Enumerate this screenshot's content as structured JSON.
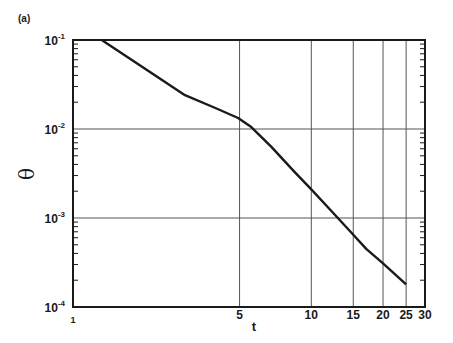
{
  "panel_label": "(a)",
  "chart_data": {
    "type": "line",
    "title": "",
    "xlabel": "t",
    "ylabel": "θ",
    "xscale": "log",
    "yscale": "log",
    "xlim": [
      1,
      30
    ],
    "ylim": [
      0.0001,
      0.1
    ],
    "grid": true,
    "legend": "none",
    "x_ticks": [
      1,
      5,
      10,
      15,
      20,
      25,
      30
    ],
    "x_tick_labels": [
      "1",
      "5",
      "10",
      "15",
      "20",
      "25",
      "30"
    ],
    "y_ticks": [
      0.1,
      0.01,
      0.001,
      0.0001
    ],
    "y_tick_labels": [
      {
        "base": "10",
        "exp": "-1"
      },
      {
        "base": "10",
        "exp": "-2"
      },
      {
        "base": "10",
        "exp": "-3"
      },
      {
        "base": "10",
        "exp": "-4"
      }
    ],
    "series": [
      {
        "name": "θ(t)",
        "x": [
          1.32,
          2.0,
          2.95,
          4.0,
          4.93,
          5.6,
          6.8,
          8.5,
          10.0,
          12.5,
          15.0,
          17.0,
          20.0,
          25.0
        ],
        "y": [
          0.1,
          0.048,
          0.024,
          0.017,
          0.0133,
          0.0105,
          0.0063,
          0.0033,
          0.0021,
          0.0011,
          0.00065,
          0.00045,
          0.00031,
          0.00018
        ]
      }
    ]
  },
  "colors": {
    "line": "#1a1a1a",
    "grid": "#555555",
    "background": "#ffffff"
  }
}
